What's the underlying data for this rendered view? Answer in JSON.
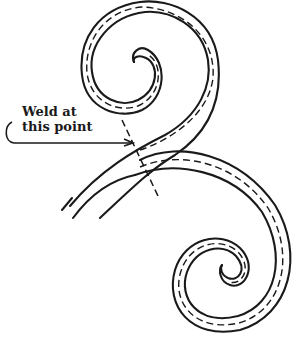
{
  "figure": {
    "type": "technical illustration",
    "annotation": {
      "line1": "Weld at",
      "line2": "this point"
    },
    "colors": {
      "ink": "#1a1a1a",
      "background": "#ffffff"
    }
  }
}
